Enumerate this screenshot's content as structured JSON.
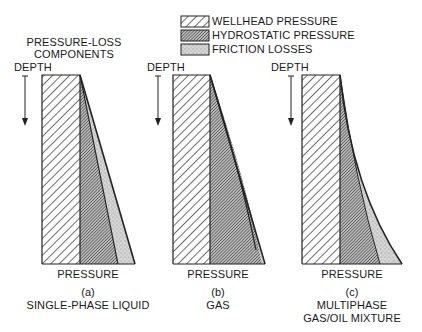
{
  "title": {
    "line1": "PRESSURE-LOSS",
    "line2": "COMPONENTS"
  },
  "legend": [
    {
      "label": "WELLHEAD PRESSURE",
      "pattern": "wide-hatch"
    },
    {
      "label": "HYDROSTATIC PRESSURE",
      "pattern": "dense-hatch"
    },
    {
      "label": "FRICTION LOSSES",
      "pattern": "stipple"
    }
  ],
  "panels": [
    {
      "id": "a",
      "y_axis_label": "DEPTH",
      "x_axis_label": "PRESSURE",
      "letter": "(a)",
      "caption_line1": "SINGLE-PHASE LIQUID",
      "caption_line2": ""
    },
    {
      "id": "b",
      "y_axis_label": "DEPTH",
      "x_axis_label": "PRESSURE",
      "letter": "(b)",
      "caption_line1": "GAS",
      "caption_line2": ""
    },
    {
      "id": "c",
      "y_axis_label": "DEPTH",
      "x_axis_label": "PRESSURE",
      "letter": "(c)",
      "caption_line1": "MULTIPHASE",
      "caption_line2": "GAS/OIL MIXTURE"
    }
  ],
  "colors": {
    "ink": "#1a1a1a",
    "stipple": "#c8c8c8",
    "background": "#ffffff"
  }
}
